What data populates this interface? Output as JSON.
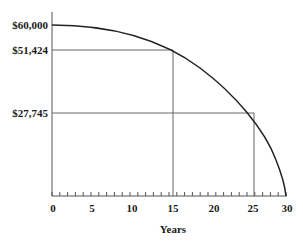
{
  "chart_data": {
    "type": "line",
    "title": "",
    "xlabel": "Years",
    "ylabel": "",
    "xlim": [
      0,
      30
    ],
    "ylim": [
      0,
      60000
    ],
    "x_ticks": [
      "0",
      "5",
      "10",
      "15",
      "20",
      "25",
      "30"
    ],
    "y_tick_labels": [
      "$60,000",
      "$51,424",
      "$27,745"
    ],
    "series": [
      {
        "name": "Remaining balance",
        "x": [
          0,
          5,
          10,
          15,
          20,
          25,
          28,
          30
        ],
        "values": [
          60000,
          58000,
          55700,
          51424,
          43000,
          27745,
          14000,
          0
        ]
      }
    ],
    "annotations": [
      {
        "x": 15,
        "y": 51424,
        "label": "$51,424"
      },
      {
        "x": 25,
        "y": 27745,
        "label": "$27,745"
      }
    ],
    "grid": false,
    "legend": "none"
  },
  "labels": {
    "y0": "$60,000",
    "y1": "$51,424",
    "y2": "$27,745",
    "x": [
      "0",
      "5",
      "10",
      "15",
      "20",
      "25",
      "30"
    ],
    "xaxis_title": "Years"
  }
}
